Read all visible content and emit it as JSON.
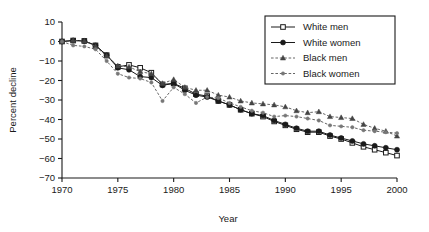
{
  "chart_data": {
    "type": "line",
    "title": "",
    "xlabel": "Year",
    "ylabel": "Percent decline",
    "xlim": [
      1970,
      2000
    ],
    "ylim": [
      -70,
      10
    ],
    "ytick_values": [
      10,
      0,
      -10,
      -20,
      -30,
      -40,
      -50,
      -60,
      -70
    ],
    "ytick_labels": [
      "10",
      "0",
      "−10",
      "−20",
      "−30",
      "−40",
      "−50",
      "−60",
      "−70"
    ],
    "xtick_values": [
      1970,
      1975,
      1980,
      1985,
      1990,
      1995,
      2000
    ],
    "xtick_labels": [
      "1970",
      "1975",
      "1980",
      "1985",
      "1990",
      "1995",
      "2000"
    ],
    "x_minor_step": 1,
    "grid": false,
    "legend_position": "top-right",
    "x": [
      1970,
      1971,
      1972,
      1973,
      1974,
      1975,
      1976,
      1977,
      1978,
      1979,
      1980,
      1981,
      1982,
      1983,
      1984,
      1985,
      1986,
      1987,
      1988,
      1989,
      1990,
      1991,
      1992,
      1993,
      1994,
      1995,
      1996,
      1997,
      1998,
      1999,
      2000
    ],
    "series": [
      {
        "name": "White men",
        "marker": "open-square",
        "linestyle": "solid",
        "color": "#1a1a1a",
        "values": [
          0,
          0.5,
          0.3,
          -2,
          -7,
          -13,
          -12,
          -13.5,
          -16,
          -22,
          -21.5,
          -24,
          -27,
          -28,
          -30.5,
          -32.5,
          -35,
          -37,
          -38.5,
          -41,
          -43,
          -45,
          -46.5,
          -46.5,
          -48.5,
          -50,
          -52,
          -54,
          -55.5,
          -57,
          -58.5
        ]
      },
      {
        "name": "White women",
        "marker": "filled-circle",
        "linestyle": "solid",
        "color": "#1a1a1a",
        "values": [
          0,
          0.5,
          0.3,
          -2,
          -7,
          -13.5,
          -14.5,
          -18,
          -18.5,
          -22.5,
          -21.5,
          -25,
          -27.5,
          -28.5,
          -30.5,
          -32.5,
          -35,
          -37,
          -38,
          -40.5,
          -42.5,
          -44.5,
          -46,
          -46,
          -48,
          -49.5,
          -51,
          -52.5,
          -53.5,
          -54.5,
          -55.5
        ]
      },
      {
        "name": "Black men",
        "marker": "filled-triangle",
        "linestyle": "dashed",
        "color": "#444444",
        "values": [
          0,
          0.5,
          0.3,
          -2.5,
          -7.5,
          -12.5,
          -13,
          -15.5,
          -16.5,
          -21.5,
          -19.5,
          -23.5,
          -25,
          -25,
          -27.5,
          -28.5,
          -30.5,
          -31.5,
          -32,
          -32.5,
          -33.5,
          -35.5,
          -36.5,
          -36,
          -38.5,
          -39,
          -39.5,
          -42.5,
          -44.5,
          -46,
          -48.5
        ]
      },
      {
        "name": "Black women",
        "marker": "filled-dot",
        "linestyle": "dashed",
        "color": "#777777",
        "values": [
          0,
          -2,
          -2.5,
          -4,
          -10,
          -16.5,
          -18.5,
          -19,
          -21,
          -30.5,
          -23.5,
          -27,
          -31.5,
          -28.5,
          -29,
          -31.5,
          -33.5,
          -35.5,
          -36.5,
          -38.5,
          -38,
          -38.5,
          -39.5,
          -40.5,
          -43,
          -43.5,
          -44,
          -45.5,
          -46,
          -46.5,
          -47
        ]
      }
    ]
  }
}
